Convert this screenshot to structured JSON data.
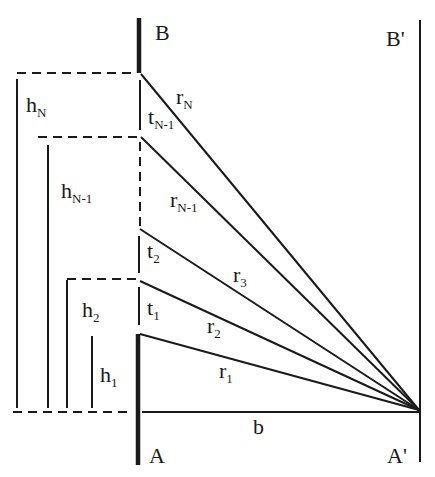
{
  "diagram": {
    "points": {
      "B": "B",
      "B_prime": "B'",
      "A": "A",
      "A_prime": "A'"
    },
    "baseline_label": "b",
    "rays": [
      {
        "main": "r",
        "sub": "N"
      },
      {
        "main": "r",
        "sub": "N-1"
      },
      {
        "main": "r",
        "sub": "3"
      },
      {
        "main": "r",
        "sub": "2"
      },
      {
        "main": "r",
        "sub": "1"
      }
    ],
    "thicknesses": [
      {
        "main": "t",
        "sub": "N-1"
      },
      {
        "main": "t",
        "sub": "2"
      },
      {
        "main": "t",
        "sub": "1"
      }
    ],
    "heights": [
      {
        "main": "h",
        "sub": "N"
      },
      {
        "main": "h",
        "sub": "N-1"
      },
      {
        "main": "h",
        "sub": "2"
      },
      {
        "main": "h",
        "sub": "1"
      }
    ],
    "colors": {
      "ink": "#1a1a1a",
      "background": "#ffffff"
    }
  }
}
